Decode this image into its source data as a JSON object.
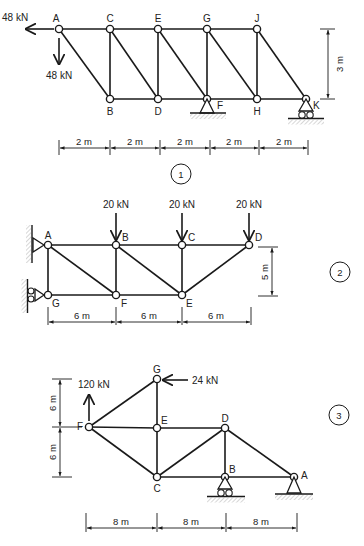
{
  "diagrams": [
    {
      "id": "1",
      "tag": "1",
      "nodes": [
        {
          "name": "A",
          "label": "A"
        },
        {
          "name": "C",
          "label": "C"
        },
        {
          "name": "E",
          "label": "E"
        },
        {
          "name": "G",
          "label": "G"
        },
        {
          "name": "J",
          "label": "J"
        },
        {
          "name": "B",
          "label": "B"
        },
        {
          "name": "D",
          "label": "D"
        },
        {
          "name": "F",
          "label": "F"
        },
        {
          "name": "H",
          "label": "H"
        },
        {
          "name": "K",
          "label": "K"
        }
      ],
      "members": [
        [
          "A",
          "C"
        ],
        [
          "C",
          "E"
        ],
        [
          "E",
          "G"
        ],
        [
          "G",
          "J"
        ],
        [
          "B",
          "D"
        ],
        [
          "D",
          "F"
        ],
        [
          "F",
          "H"
        ],
        [
          "H",
          "K"
        ],
        [
          "C",
          "B"
        ],
        [
          "E",
          "D"
        ],
        [
          "G",
          "F"
        ],
        [
          "J",
          "H"
        ],
        [
          "A",
          "B"
        ],
        [
          "C",
          "D"
        ],
        [
          "E",
          "F"
        ],
        [
          "G",
          "H"
        ],
        [
          "J",
          "K"
        ]
      ],
      "loads": [
        {
          "node": "A",
          "direction": "left",
          "label": "48 kN"
        },
        {
          "node": "A",
          "direction": "down",
          "label": "48 kN"
        }
      ],
      "supports": [
        {
          "node": "F",
          "type": "pin"
        },
        {
          "node": "K",
          "type": "roller"
        }
      ],
      "dimensions": {
        "horizontal": [
          "2 m",
          "2 m",
          "2 m",
          "2 m",
          "2 m"
        ],
        "vertical": [
          "3 m"
        ]
      }
    },
    {
      "id": "2",
      "tag": "2",
      "nodes": [
        {
          "name": "A",
          "label": "A"
        },
        {
          "name": "B",
          "label": "B"
        },
        {
          "name": "C",
          "label": "C"
        },
        {
          "name": "D",
          "label": "D"
        },
        {
          "name": "G",
          "label": "G"
        },
        {
          "name": "F",
          "label": "F"
        },
        {
          "name": "E",
          "label": "E"
        }
      ],
      "members": [
        [
          "A",
          "B"
        ],
        [
          "B",
          "C"
        ],
        [
          "C",
          "D"
        ],
        [
          "G",
          "F"
        ],
        [
          "F",
          "E"
        ],
        [
          "A",
          "G"
        ],
        [
          "B",
          "F"
        ],
        [
          "C",
          "E"
        ],
        [
          "A",
          "F"
        ],
        [
          "B",
          "E"
        ],
        [
          "E",
          "D"
        ]
      ],
      "loads": [
        {
          "node": "B",
          "direction": "down",
          "label": "20 kN"
        },
        {
          "node": "C",
          "direction": "down",
          "label": "20 kN"
        },
        {
          "node": "D",
          "direction": "down",
          "label": "20 kN"
        }
      ],
      "supports": [
        {
          "node": "A",
          "type": "wall-pin"
        },
        {
          "node": "G",
          "type": "wall-roller"
        }
      ],
      "dimensions": {
        "horizontal": [
          "6 m",
          "6 m",
          "6 m"
        ],
        "vertical": [
          "5 m"
        ]
      }
    },
    {
      "id": "3",
      "tag": "3",
      "nodes": [
        {
          "name": "F",
          "label": "F"
        },
        {
          "name": "G",
          "label": "G"
        },
        {
          "name": "E",
          "label": "E"
        },
        {
          "name": "C",
          "label": "C"
        },
        {
          "name": "D",
          "label": "D"
        },
        {
          "name": "B",
          "label": "B"
        },
        {
          "name": "A",
          "label": "A"
        }
      ],
      "members": [
        [
          "F",
          "G"
        ],
        [
          "F",
          "E"
        ],
        [
          "F",
          "C"
        ],
        [
          "G",
          "E"
        ],
        [
          "E",
          "C"
        ],
        [
          "E",
          "D"
        ],
        [
          "C",
          "D"
        ],
        [
          "C",
          "B"
        ],
        [
          "D",
          "B"
        ],
        [
          "B",
          "A"
        ],
        [
          "D",
          "A"
        ]
      ],
      "loads": [
        {
          "node": "F",
          "direction": "up",
          "label": "120 kN"
        },
        {
          "node": "G",
          "direction": "left",
          "label": "24 kN"
        }
      ],
      "supports": [
        {
          "node": "B",
          "type": "roller"
        },
        {
          "node": "A",
          "type": "pin"
        }
      ],
      "dimensions": {
        "horizontal": [
          "8 m",
          "8 m",
          "8 m"
        ],
        "vertical": [
          "6 m",
          "6 m"
        ]
      }
    }
  ]
}
